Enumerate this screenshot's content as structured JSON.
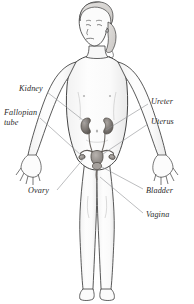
{
  "illustration": {
    "title": "Female urinary and reproductive system",
    "subject": "young girl, full body, front view",
    "background_color": "#ffffff",
    "line_color": "#3a3a3a",
    "leader_line_color": "#8e9094",
    "organ_fill_color": "#8e8a88",
    "label_color": "#2b2b2b"
  },
  "labels": [
    {
      "id": "kidney",
      "text": "Kidney",
      "side": "left",
      "x": 19,
      "y": 88,
      "lines": [
        "Kidney"
      ]
    },
    {
      "id": "fallopian-tube",
      "text": "Fallopian tube",
      "side": "left",
      "x": 4,
      "y": 112,
      "lines": [
        "Fallopian",
        "tube"
      ]
    },
    {
      "id": "ovary",
      "text": "Ovary",
      "side": "left",
      "x": 28,
      "y": 190,
      "lines": [
        "Ovary"
      ]
    },
    {
      "id": "ureter",
      "text": "Ureter",
      "side": "right",
      "x": 151,
      "y": 101,
      "lines": [
        "Ureter"
      ]
    },
    {
      "id": "uterus",
      "text": "Uterus",
      "side": "right",
      "x": 151,
      "y": 121,
      "lines": [
        "Uterus"
      ]
    },
    {
      "id": "bladder",
      "text": "Bladder",
      "side": "right",
      "x": 146,
      "y": 190,
      "lines": [
        "Bladder"
      ]
    },
    {
      "id": "vagina",
      "text": "Vagina",
      "side": "right",
      "x": 146,
      "y": 214,
      "lines": [
        "Vagina"
      ]
    }
  ],
  "organs": [
    {
      "id": "kidney-left",
      "name": "kidney"
    },
    {
      "id": "kidney-right",
      "name": "kidney"
    },
    {
      "id": "ureter-left",
      "name": "ureter"
    },
    {
      "id": "ureter-right",
      "name": "ureter"
    },
    {
      "id": "uterus",
      "name": "uterus"
    },
    {
      "id": "fallopian-tube-left",
      "name": "fallopian-tube"
    },
    {
      "id": "fallopian-tube-right",
      "name": "fallopian-tube"
    },
    {
      "id": "ovary-left",
      "name": "ovary"
    },
    {
      "id": "ovary-right",
      "name": "ovary"
    },
    {
      "id": "bladder",
      "name": "bladder"
    },
    {
      "id": "vagina",
      "name": "vagina"
    }
  ]
}
